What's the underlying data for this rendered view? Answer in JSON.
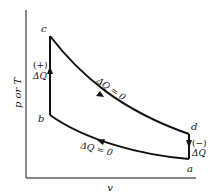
{
  "diagram": {
    "type": "thermodynamic-cycle",
    "axes": {
      "y_label": "p or T",
      "x_label": "v"
    },
    "points": [
      {
        "id": "c",
        "label": "c"
      },
      {
        "id": "b",
        "label": "b"
      },
      {
        "id": "d",
        "label": "d"
      },
      {
        "id": "a",
        "label": "a"
      }
    ],
    "processes": [
      {
        "from": "b",
        "to": "c",
        "kind": "heat-addition",
        "sign_label": "(+)",
        "heat_label": "ΔQ"
      },
      {
        "from": "c",
        "to": "d",
        "kind": "adiabatic-expansion",
        "label": "ΔQ = 0"
      },
      {
        "from": "d",
        "to": "a",
        "kind": "heat-rejection",
        "sign_label": "(−)",
        "heat_label": "ΔQ"
      },
      {
        "from": "a",
        "to": "b",
        "kind": "adiabatic-compression",
        "label": "ΔQ = 0"
      }
    ],
    "colors": {
      "line": "#111111",
      "background": "#ffffff"
    }
  }
}
